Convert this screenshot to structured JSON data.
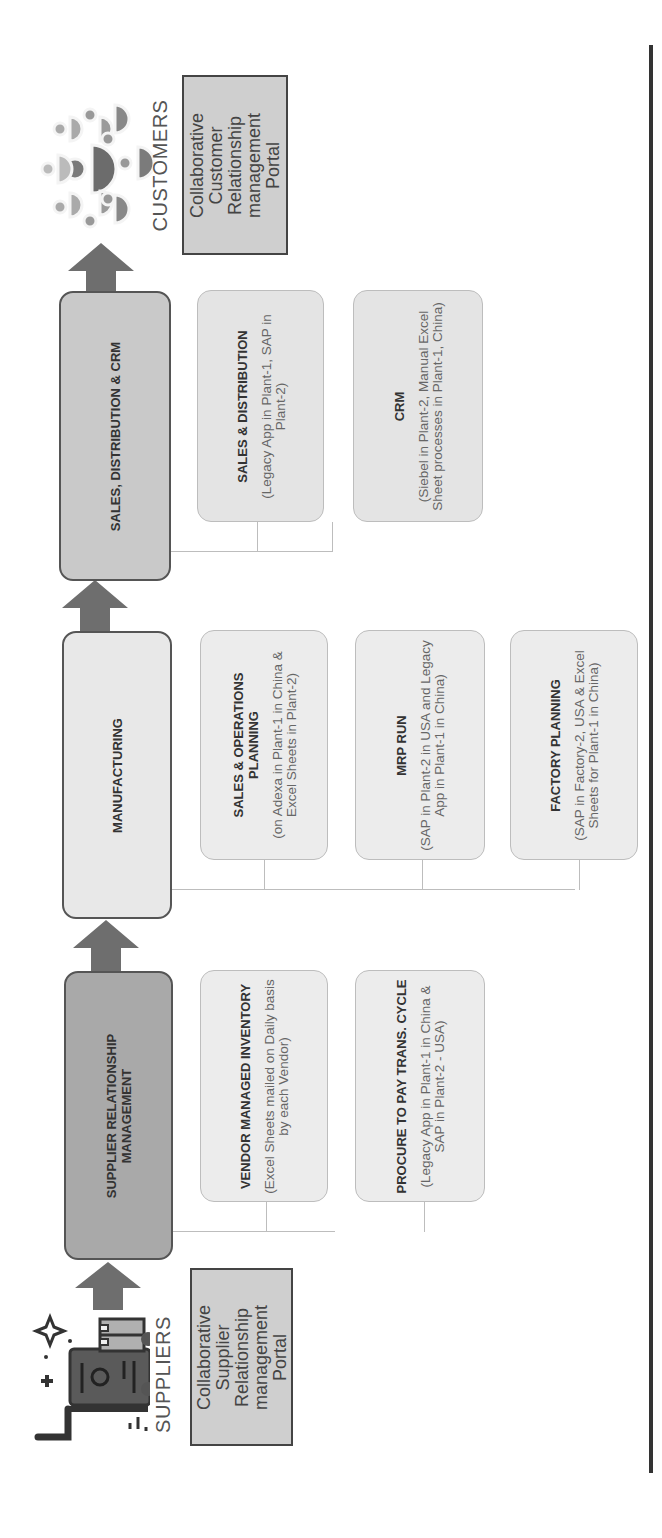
{
  "diagram": {
    "orientation": "rotated-90-ccw",
    "flow_direction": "suppliers-to-customers",
    "colors": {
      "srm_box": "#a9a9a9",
      "manufacturing_box": "#e8e8e8",
      "sales_box": "#c9c9c9",
      "sub_box": "#e4e4e4",
      "portal_box": "#cfcfcf",
      "arrow": "#6e6e6e",
      "frame_line": "#333333"
    }
  },
  "endpoints": {
    "suppliers": {
      "label": "SUPPLIERS",
      "icon": "supplier-cart-icon",
      "portal": "Collaborative Supplier Relationship management Portal"
    },
    "customers": {
      "label": "CUSTOMERS",
      "icon": "customer-network-icon",
      "portal": "Collaborative Customer Relationship management Portal"
    }
  },
  "stages": [
    {
      "id": "srm",
      "title": "SUPPLIER RELATIONSHIP MANAGEMENT",
      "processes": [
        {
          "title": "VENDOR MANAGED INVENTORY",
          "desc": "(Excel Sheets mailed on Daily basis by each Vendor)"
        },
        {
          "title": "PROCURE TO PAY TRANS. CYCLE",
          "desc": "(Legacy App in Plant-1 in China  & SAP in Plant-2 - USA)"
        }
      ]
    },
    {
      "id": "manufacturing",
      "title": "MANUFACTURING",
      "processes": [
        {
          "title": "SALES & OPERATIONS PLANNING",
          "desc": "(on Adexa in Plant-1 in China & Excel Sheets in Plant-2)"
        },
        {
          "title": "MRP RUN",
          "desc": "(SAP in Plant-2 in USA and Legacy App in Plant-1 in China)"
        },
        {
          "title": "FACTORY PLANNING",
          "desc": "(SAP in Factory-2, USA & Excel Sheets for Plant-1 in China)"
        }
      ]
    },
    {
      "id": "sales",
      "title": "SALES, DISTRIBUTION & CRM",
      "processes": [
        {
          "title": "SALES & DISTRIBUTION",
          "desc": "(Legacy App in Plant-1, SAP in Plant-2)"
        },
        {
          "title": "CRM",
          "desc": "(Siebel in Plant-2, Manual Excel Sheet processes in Plant-1, China)"
        }
      ]
    }
  ]
}
